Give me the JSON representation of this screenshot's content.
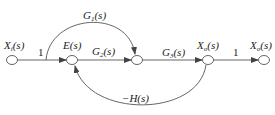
{
  "diagram": {
    "type": "signal-flow-graph",
    "colors": {
      "line": "#555555",
      "node_fill": "#ffffff",
      "text": "#222222"
    },
    "nodes": [
      {
        "id": "xi",
        "label_main": "X",
        "label_sub": "i",
        "label_tail": "(s)",
        "x": 12,
        "y": 60
      },
      {
        "id": "e",
        "label_main": "E(s)",
        "x": 72,
        "y": 60
      },
      {
        "id": "n3",
        "x": 137,
        "y": 60
      },
      {
        "id": "xo_mid",
        "label_main": "X",
        "label_sub": "o",
        "label_tail": "(s)",
        "x": 208,
        "y": 60
      },
      {
        "id": "xo_out",
        "label_main": "X",
        "label_sub": "o",
        "label_tail": "(s)",
        "x": 264,
        "y": 60
      }
    ],
    "branches": [
      {
        "from": "xi",
        "to": "e",
        "gain": "1"
      },
      {
        "from": "e",
        "to": "n3",
        "gain_main": "G",
        "gain_sub": "2",
        "gain_tail": "(s)"
      },
      {
        "from": "n3",
        "to": "xo_mid",
        "gain_main": "G",
        "gain_sub": "3",
        "gain_tail": "(s)"
      },
      {
        "from": "xo_mid",
        "to": "xo_out",
        "gain": "1"
      },
      {
        "from": "xi-e-branch",
        "to": "n3",
        "gain_main": "G",
        "gain_sub": "1",
        "gain_tail": "(s)",
        "shape": "arc-over"
      },
      {
        "from": "xo_mid",
        "to": "e",
        "gain": "−H(s)",
        "shape": "arc-under"
      }
    ]
  }
}
